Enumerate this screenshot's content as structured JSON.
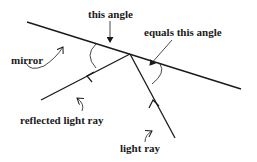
{
  "labels": {
    "this_angle": "this angle",
    "equals_this_angle": "equals this angle",
    "mirror": "mirror",
    "reflected_light_ray": "reflected light ray",
    "light_ray": "light ray"
  },
  "colors": {
    "line": "#1a1a1a",
    "background": "#ffffff"
  }
}
